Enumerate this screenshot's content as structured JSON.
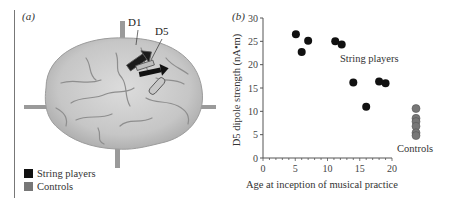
{
  "panels": {
    "a": {
      "label": "(a)"
    },
    "b": {
      "label": "(b)"
    }
  },
  "brain": {
    "dipole_labels": [
      "D1",
      "D5"
    ]
  },
  "legend": {
    "items": [
      {
        "label": "String players",
        "color": "#111111"
      },
      {
        "label": "Controls",
        "color": "#777777"
      }
    ]
  },
  "chart_data": {
    "type": "scatter",
    "title": "",
    "xlabel": "Age at inception of musical practice",
    "ylabel": "D5 dipole strength (nA•m)",
    "xlim": [
      0,
      20
    ],
    "ylim": [
      0,
      30
    ],
    "x_ticks": [
      0,
      5,
      10,
      15,
      20
    ],
    "y_ticks": [
      0,
      5,
      10,
      15,
      20,
      25,
      30
    ],
    "grid": false,
    "legend_position": "panel (a) bottom-left",
    "series": [
      {
        "name": "String players",
        "color": "#111111",
        "points": [
          {
            "x": 5.1,
            "y": 26.5
          },
          {
            "x": 6.0,
            "y": 22.7
          },
          {
            "x": 7.0,
            "y": 25.1
          },
          {
            "x": 11.2,
            "y": 25.0
          },
          {
            "x": 12.2,
            "y": 24.3
          },
          {
            "x": 14.0,
            "y": 16.2
          },
          {
            "x": 16.0,
            "y": 11.0
          },
          {
            "x": 18.0,
            "y": 16.4
          },
          {
            "x": 19.0,
            "y": 16.0
          }
        ]
      },
      {
        "name": "Controls",
        "color": "#777777",
        "x_position": "off-axis (right of 20)",
        "points": [
          {
            "y": 10.6
          },
          {
            "y": 8.5
          },
          {
            "y": 7.8
          },
          {
            "y": 6.8
          },
          {
            "y": 5.4
          },
          {
            "y": 4.8
          }
        ]
      }
    ],
    "annotations": [
      {
        "text": "String players",
        "near": "x≈16, y≈21"
      },
      {
        "text": "Controls",
        "near": "below control cluster"
      }
    ]
  }
}
